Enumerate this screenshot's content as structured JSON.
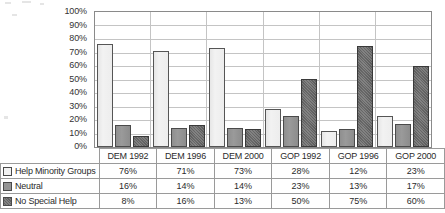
{
  "chart_data": {
    "type": "bar",
    "title": "",
    "subtitle": "",
    "xlabel": "",
    "ylabel": "",
    "categories": [
      "DEM 1992",
      "DEM 1996",
      "DEM 2000",
      "GOP 1992",
      "GOP 1996",
      "GOP 2000"
    ],
    "series": [
      {
        "name": "Help Minority Groups",
        "values": [
          76,
          71,
          73,
          28,
          12,
          23
        ],
        "color": "#f2f2f2"
      },
      {
        "name": "Neutral",
        "values": [
          16,
          14,
          14,
          23,
          13,
          17
        ],
        "color": "#959595"
      },
      {
        "name": "No Special Help",
        "values": [
          8,
          16,
          13,
          50,
          75,
          60
        ],
        "color": "#636363"
      }
    ],
    "value_labels": [
      [
        "76%",
        "71%",
        "73%",
        "28%",
        "12%",
        "23%"
      ],
      [
        "16%",
        "14%",
        "14%",
        "23%",
        "13%",
        "17%"
      ],
      [
        "8%",
        "16%",
        "13%",
        "50%",
        "75%",
        "60%"
      ]
    ],
    "ylim": [
      0,
      100
    ],
    "ytick_values": [
      0,
      10,
      20,
      30,
      40,
      50,
      60,
      70,
      80,
      90,
      100
    ],
    "ytick_labels": [
      "0%",
      "10%",
      "20%",
      "30%",
      "40%",
      "50%",
      "60%",
      "70%",
      "80%",
      "90%",
      "100%"
    ],
    "grid": "horizontal",
    "legend_position": "data-table-left-column",
    "has_data_table": true
  },
  "table": {
    "corner_label": "",
    "column_headers": [
      "DEM 1992",
      "DEM 1996",
      "DEM 2000",
      "GOP 1992",
      "GOP 1996",
      "GOP 2000"
    ],
    "rows": [
      {
        "label": "Help Minority Groups",
        "swatch": "series-0-swatch-icon",
        "values": [
          "76%",
          "71%",
          "73%",
          "28%",
          "12%",
          "23%"
        ]
      },
      {
        "label": "Neutral",
        "swatch": "series-1-swatch-icon",
        "values": [
          "16%",
          "14%",
          "14%",
          "23%",
          "13%",
          "17%"
        ]
      },
      {
        "label": "No Special Help",
        "swatch": "series-2-swatch-icon",
        "values": [
          "8%",
          "16%",
          "13%",
          "50%",
          "75%",
          "60%"
        ]
      }
    ]
  },
  "colors": {
    "series_0": "#f2f2f2",
    "series_1": "#959595",
    "series_2": "#636363",
    "gridline": "#c4c4c4",
    "plot_border": "#8a8a8a",
    "table_border": "#9a9a9a",
    "text": "#2b2b2b",
    "background": "#ffffff"
  }
}
